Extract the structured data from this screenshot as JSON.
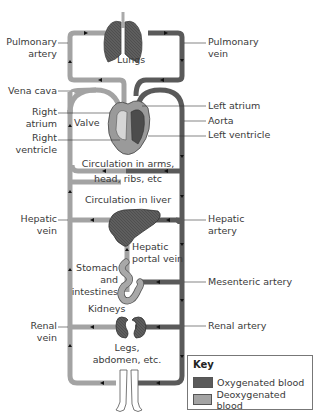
{
  "colors": {
    "oxygenated": "#5a5a5a",
    "deoxygenated": "#a3a3a3",
    "organ_dark": "#606060",
    "organ_light": "#9a9a9a"
  },
  "organs": {
    "lungs": "Lungs",
    "circulation_upper": "Circulation in arms,",
    "circulation_upper_2": "head, ribs, etc",
    "circulation_liver": "Circulation in liver",
    "stomach": "Stomach",
    "stomach_2": "and",
    "stomach_3": "intestines",
    "kidneys": "Kidneys",
    "legs": "Legs,",
    "legs_2": "abdomen, etc.",
    "valve": "Valve",
    "hepatic_portal": "Hepatic",
    "hepatic_portal_2": "portal vein"
  },
  "left_labels": {
    "pulmonary_artery": "Pulmonary",
    "pulmonary_artery_2": "artery",
    "vena_cava": "Vena cava",
    "right_atrium": "Right",
    "right_atrium_2": "atrium",
    "right_ventricle": "Right",
    "right_ventricle_2": "ventricle",
    "hepatic_vein": "Hepatic",
    "hepatic_vein_2": "vein",
    "renal_vein": "Renal",
    "renal_vein_2": "vein"
  },
  "right_labels": {
    "pulmonary_vein": "Pulmonary",
    "pulmonary_vein_2": "vein",
    "left_atrium": "Left atrium",
    "aorta": "Aorta",
    "left_ventricle": "Left ventricle",
    "hepatic_artery": "Hepatic",
    "hepatic_artery_2": "artery",
    "mesenteric_artery": "Mesenteric artery",
    "renal_artery": "Renal artery"
  },
  "key": {
    "title": "Key",
    "items": [
      {
        "label": "Oxygenated blood",
        "color": "#5a5a5a"
      },
      {
        "label": "Deoxygenated blood",
        "color": "#a3a3a3"
      }
    ]
  }
}
